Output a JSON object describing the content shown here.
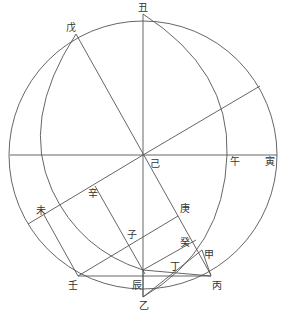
{
  "diagram": {
    "line_color": "#555555",
    "label_color": "#333333",
    "background": "#ffffff",
    "outer_circle": {
      "cx": 143,
      "cy": 155,
      "r": 134
    },
    "labels": {
      "chou": "丑",
      "wu_top": "戊",
      "ji": "己",
      "wu_noon": "午",
      "yin": "寅",
      "wei": "未",
      "xin": "辛",
      "geng": "庚",
      "zi": "子",
      "gui": "癸",
      "jia": "甲",
      "ding": "丁",
      "ren": "壬",
      "chen": "辰",
      "bing": "丙",
      "yi": "乙"
    }
  }
}
